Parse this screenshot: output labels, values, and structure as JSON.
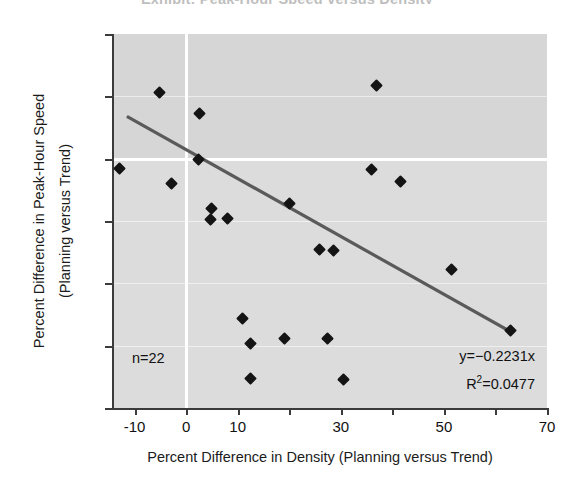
{
  "title": "Exhibit: Peak-Hour Speed versus Density",
  "axes": {
    "x_label": "Percent Difference in Density (Planning versus Trend)",
    "y_label_line1": "Percent Difference in Peak-Hour Speed",
    "y_label_line2": "(Planning versus Trend)"
  },
  "annotations": {
    "sample_size": "n=22",
    "equation": "y=−0.2231x",
    "r_squared_prefix": "R",
    "r_squared_sup": "2",
    "r_squared_value": "=0.0477"
  },
  "colors": {
    "plot_background": "#dcdcdc",
    "marker": "#141414",
    "trendline": "#5a5a5a",
    "gridline": "#ffffff",
    "axis": "#3b3b3b",
    "text": "#111111"
  },
  "chart_data": {
    "type": "scatter",
    "title": "Exhibit: Peak-Hour Speed versus Density",
    "xlabel": "Percent Difference in Density (Planning versus Trend)",
    "ylabel": "Percent Difference in Peak-Hour Speed (Planning versus Trend)",
    "xlim": [
      -14,
      70
    ],
    "ylim": [
      -20,
      10
    ],
    "xticks": [
      -10,
      0,
      10,
      20,
      30,
      40,
      50,
      60,
      70
    ],
    "xticklabels": [
      "-10",
      "0",
      "10",
      "",
      "30",
      "",
      "50",
      "",
      "70"
    ],
    "yticks": [
      10,
      5,
      0,
      -5,
      -10,
      -15,
      -20
    ],
    "yticklabels": [
      "10",
      "5",
      "0",
      "-5",
      "-10",
      "-15",
      "-20"
    ],
    "grid": true,
    "gridlines_horizontal": [
      5,
      0,
      -5,
      -10,
      -15
    ],
    "gridline_vertical": 0,
    "n": 22,
    "series": [
      {
        "name": "Scenario observations",
        "marker": "diamond",
        "points": [
          {
            "x": -5.2,
            "y": 5.3
          },
          {
            "x": 2.6,
            "y": 3.6
          },
          {
            "x": 37.0,
            "y": 5.9
          },
          {
            "x": 2.3,
            "y": -0.1
          },
          {
            "x": -13.0,
            "y": -0.8
          },
          {
            "x": 36.0,
            "y": -0.9
          },
          {
            "x": -2.8,
            "y": -2.0
          },
          {
            "x": 41.5,
            "y": -1.8
          },
          {
            "x": 5.0,
            "y": -4.0
          },
          {
            "x": 4.8,
            "y": -4.9
          },
          {
            "x": 8.0,
            "y": -4.8
          },
          {
            "x": 20.0,
            "y": -3.6
          },
          {
            "x": 25.8,
            "y": -7.3
          },
          {
            "x": 28.5,
            "y": -7.4
          },
          {
            "x": 51.5,
            "y": -8.9
          },
          {
            "x": 63.0,
            "y": -13.8
          },
          {
            "x": 11.0,
            "y": -12.8
          },
          {
            "x": 12.5,
            "y": -14.8
          },
          {
            "x": 19.0,
            "y": -14.4
          },
          {
            "x": 27.5,
            "y": -14.4
          },
          {
            "x": 12.5,
            "y": -17.6
          },
          {
            "x": 30.5,
            "y": -17.7
          }
        ]
      }
    ],
    "trendline": {
      "equation": "y=-0.2231x",
      "slope": -0.2231,
      "intercept": 0.0,
      "r_squared": 0.0477,
      "x_start": -11.5,
      "y_start": 3.4,
      "x_end": 63.0,
      "y_end": -13.9
    }
  }
}
